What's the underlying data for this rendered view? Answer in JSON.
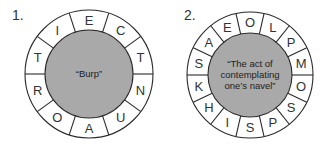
{
  "colors": {
    "ring_fill": "#ffffff",
    "center_fill": "#a9a9a9",
    "stroke": "#2a2a2a"
  },
  "puzzles": [
    {
      "number": "1.",
      "center": [
        89,
        74
      ],
      "outer_r": 64,
      "inner_r": 44,
      "letters_clockwise_from_top": [
        "E",
        "C",
        "T",
        "N",
        "U",
        "A",
        "O",
        "R",
        "T",
        "I"
      ],
      "clue_lines": [
        "“Burp”"
      ]
    },
    {
      "number": "2.",
      "center": [
        250,
        75
      ],
      "outer_r": 63,
      "inner_r": 42,
      "letters_clockwise_from_top": [
        "O",
        "L",
        "P",
        "M",
        "O",
        "S",
        "P",
        "S",
        "I",
        "H",
        "K",
        "S",
        "A",
        "E"
      ],
      "clue_lines": [
        "“The act of",
        "contemplating",
        "one’s navel”"
      ]
    }
  ]
}
